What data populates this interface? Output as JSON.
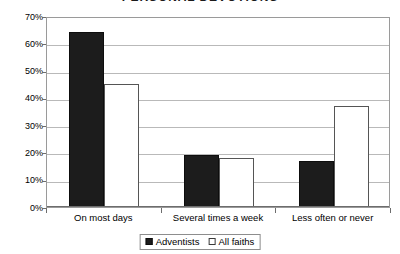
{
  "chart_data": {
    "type": "bar",
    "title": "PERSONAL DEVOTIONS",
    "xlabel": "",
    "ylabel": "",
    "ylim": [
      0,
      70
    ],
    "ytick_step": 10,
    "grid": true,
    "legend_position": "bottom",
    "categories": [
      "On most days",
      "Several times a week",
      "Less often or never"
    ],
    "ytick_labels": [
      "70%",
      "60%",
      "50%",
      "40%",
      "30%",
      "20%",
      "10%",
      "0%"
    ],
    "ytick_values": [
      70,
      60,
      50,
      40,
      30,
      20,
      10,
      0
    ],
    "series": [
      {
        "name": "Adventists",
        "color": "#1c1c1c",
        "values": [
          64,
          19,
          17
        ]
      },
      {
        "name": "All faiths",
        "color": "#ffffff",
        "values": [
          45,
          18,
          37
        ]
      }
    ]
  },
  "legend": {
    "items": [
      {
        "label": "Adventists",
        "style": "filled"
      },
      {
        "label": "All faiths",
        "style": "outlined"
      }
    ]
  }
}
